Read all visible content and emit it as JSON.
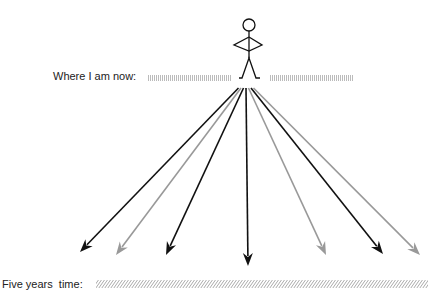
{
  "labels": {
    "now": "Where I am now:",
    "future": "Five years  time:"
  },
  "figure": {
    "name": "stick figure",
    "origin": [
      246,
      88
    ]
  },
  "arrows": [
    {
      "tip": [
        80,
        252
      ],
      "color": "#111111"
    },
    {
      "tip": [
        116,
        255
      ],
      "color": "#999999"
    },
    {
      "tip": [
        166,
        255
      ],
      "color": "#111111"
    },
    {
      "tip": [
        248,
        266
      ],
      "color": "#111111"
    },
    {
      "tip": [
        326,
        255
      ],
      "color": "#999999"
    },
    {
      "tip": [
        383,
        254
      ],
      "color": "#111111"
    },
    {
      "tip": [
        420,
        255
      ],
      "color": "#999999"
    }
  ],
  "colors": {
    "dark": "#111111",
    "light": "#999999",
    "hatch": "#bbbbbb"
  }
}
